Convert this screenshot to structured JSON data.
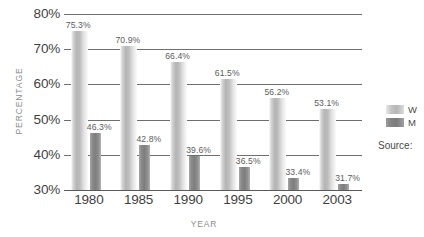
{
  "chart_data": {
    "type": "bar",
    "title": "",
    "xlabel": "YEAR",
    "ylabel": "PERCENTAGE",
    "categories": [
      "1980",
      "1985",
      "1990",
      "1995",
      "2000",
      "2003"
    ],
    "series": [
      {
        "name": "W",
        "color": "#b8b8b8",
        "values": [
          75.3,
          70.9,
          66.4,
          61.5,
          56.2,
          53.1
        ],
        "labels": [
          "75.3%",
          "70.9%",
          "66.4%",
          "61.5%",
          "56.2%",
          "53.1%"
        ]
      },
      {
        "name": "M",
        "color": "#808080",
        "values": [
          46.3,
          42.8,
          39.6,
          36.5,
          33.4,
          31.7
        ],
        "labels": [
          "46.3%",
          "42.8%",
          "39.6%",
          "36.5%",
          "33.4%",
          "31.7%"
        ]
      }
    ],
    "ylim": [
      30,
      80
    ],
    "yticks": [
      80,
      70,
      60,
      50,
      40,
      30
    ],
    "ytick_labels": [
      "80%",
      "70%",
      "60%",
      "50%",
      "40%",
      "30%"
    ],
    "grid": true,
    "legend_position": "right"
  },
  "legend": {
    "items": [
      {
        "label": "W"
      },
      {
        "label": "M"
      }
    ]
  },
  "notes": {
    "source": "Source:"
  }
}
